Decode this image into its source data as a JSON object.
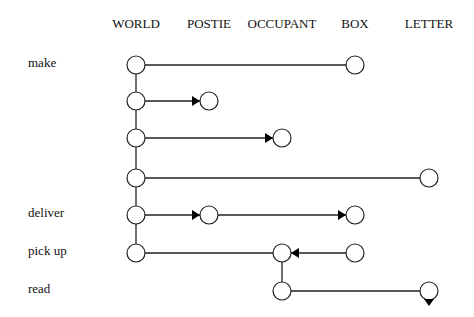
{
  "columns": [
    {
      "label": "WORLD",
      "x": 136
    },
    {
      "label": "POSTIE",
      "x": 209
    },
    {
      "label": "OCCUPANT",
      "x": 282
    },
    {
      "label": "BOX",
      "x": 355
    },
    {
      "label": "LETTER",
      "x": 429
    }
  ],
  "rows": [
    {
      "label": "make",
      "y": 65
    },
    {
      "label": "",
      "y": 101
    },
    {
      "label": "",
      "y": 138
    },
    {
      "label": "",
      "y": 178
    },
    {
      "label": "deliver",
      "y": 215
    },
    {
      "label": "pick up",
      "y": 253
    },
    {
      "label": "read",
      "y": 291
    }
  ],
  "nodes": [
    {
      "col": 0,
      "row": 0
    },
    {
      "col": 3,
      "row": 0
    },
    {
      "col": 0,
      "row": 1
    },
    {
      "col": 1,
      "row": 1
    },
    {
      "col": 0,
      "row": 2
    },
    {
      "col": 2,
      "row": 2
    },
    {
      "col": 0,
      "row": 3
    },
    {
      "col": 4,
      "row": 3
    },
    {
      "col": 0,
      "row": 4
    },
    {
      "col": 1,
      "row": 4
    },
    {
      "col": 3,
      "row": 4
    },
    {
      "col": 0,
      "row": 5
    },
    {
      "col": 2,
      "row": 5
    },
    {
      "col": 3,
      "row": 5
    },
    {
      "col": 2,
      "row": 6
    },
    {
      "col": 4,
      "row": 6
    }
  ],
  "edges": [
    {
      "from": [
        0,
        0
      ],
      "to": [
        3,
        0
      ],
      "arrow": "none"
    },
    {
      "from": [
        0,
        1
      ],
      "to": [
        1,
        1
      ],
      "arrow": "end"
    },
    {
      "from": [
        0,
        2
      ],
      "to": [
        2,
        2
      ],
      "arrow": "end"
    },
    {
      "from": [
        0,
        3
      ],
      "to": [
        4,
        3
      ],
      "arrow": "none"
    },
    {
      "from": [
        0,
        4
      ],
      "to": [
        1,
        4
      ],
      "arrow": "end"
    },
    {
      "from": [
        1,
        4
      ],
      "to": [
        3,
        4
      ],
      "arrow": "end"
    },
    {
      "from": [
        0,
        5
      ],
      "to": [
        2,
        5
      ],
      "arrow": "none"
    },
    {
      "from": [
        3,
        5
      ],
      "to": [
        2,
        5
      ],
      "arrow": "end"
    },
    {
      "from": [
        2,
        6
      ],
      "to": [
        4,
        6
      ],
      "arrow": "none"
    }
  ],
  "verticals": [
    {
      "col": 0,
      "from_row": 0,
      "to_row": 5
    },
    {
      "col": 2,
      "from_row": 5,
      "to_row": 6
    }
  ],
  "down_markers": [
    {
      "col": 4,
      "row": 6
    }
  ],
  "style": {
    "stroke": "#222222",
    "node_fill": "#ffffff",
    "node_radius": 9
  }
}
